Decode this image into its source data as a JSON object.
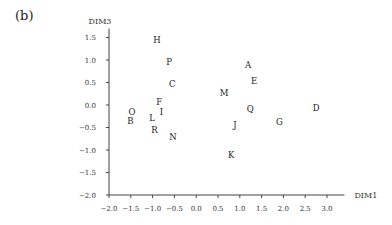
{
  "panel_label": "(b)",
  "chart_data": {
    "type": "scatter",
    "title": "",
    "xlabel": "DIM1",
    "ylabel": "DIM3",
    "xlim": [
      -2.0,
      3.2
    ],
    "ylim": [
      -2.0,
      1.7
    ],
    "grid": false,
    "legend": null,
    "xticks": [
      "-2.0",
      "-1.5",
      "-1.0",
      "-0.5",
      "0.0",
      "0.5",
      "1.0",
      "1.5",
      "2.0",
      "2.5",
      "3.0"
    ],
    "yticks": [
      "1.5",
      "1.0",
      "0.5",
      "0.0",
      "-0.5",
      "-1.0",
      "-1.5",
      "-2.0"
    ],
    "points": [
      {
        "label": "H",
        "x": -0.9,
        "y": 1.45
      },
      {
        "label": "P",
        "x": -0.62,
        "y": 0.96
      },
      {
        "label": "C",
        "x": -0.55,
        "y": 0.47
      },
      {
        "label": "F",
        "x": -0.85,
        "y": 0.07
      },
      {
        "label": "I",
        "x": -0.8,
        "y": -0.16
      },
      {
        "label": "O",
        "x": -1.47,
        "y": -0.16
      },
      {
        "label": "B",
        "x": -1.51,
        "y": -0.36
      },
      {
        "label": "L",
        "x": -1.01,
        "y": -0.29
      },
      {
        "label": "R",
        "x": -0.96,
        "y": -0.56
      },
      {
        "label": "N",
        "x": -0.53,
        "y": -0.71
      },
      {
        "label": "A",
        "x": 1.19,
        "y": 0.89
      },
      {
        "label": "E",
        "x": 1.33,
        "y": 0.53
      },
      {
        "label": "M",
        "x": 0.64,
        "y": 0.27
      },
      {
        "label": "Q",
        "x": 1.24,
        "y": -0.09
      },
      {
        "label": "D",
        "x": 2.75,
        "y": -0.07
      },
      {
        "label": "J",
        "x": 0.89,
        "y": -0.44
      },
      {
        "label": "G",
        "x": 1.91,
        "y": -0.38
      },
      {
        "label": "K",
        "x": 0.8,
        "y": -1.11
      }
    ]
  }
}
